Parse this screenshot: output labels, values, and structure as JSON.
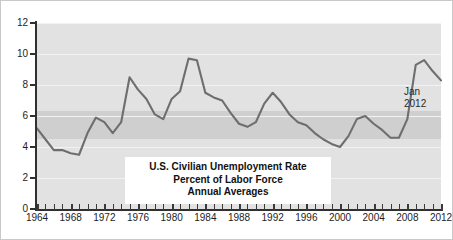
{
  "chart_data": {
    "type": "line",
    "title": "U.S. Civilian Unemployment Rate",
    "subtitle": "Percent of Labor Force",
    "subtitle2": "Annual Averages",
    "xlabel": "",
    "ylabel": "",
    "xlim": [
      1964,
      2012
    ],
    "ylim": [
      0,
      12
    ],
    "grid": true,
    "legend": null,
    "y_ticks": [
      0,
      2,
      4,
      6,
      8,
      10,
      12
    ],
    "y_tick_labels": [
      "0",
      "2",
      "4",
      "6",
      "8",
      "10",
      "12"
    ],
    "x_ticks": [
      1964,
      1968,
      1972,
      1976,
      1980,
      1984,
      1988,
      1992,
      1996,
      2000,
      2004,
      2008,
      2012
    ],
    "x_tick_labels": [
      "1964",
      "1968",
      "1972",
      "1976",
      "1980",
      "1984",
      "1988",
      "1992",
      "1996",
      "2000",
      "2004",
      "2008",
      "2012"
    ],
    "x_minor_tick_interval": 1,
    "shaded_band": {
      "from": 4.5,
      "to": 6.3,
      "color": "#cfcfcf"
    },
    "plot_background": "#e2e2e2",
    "line_color": "#6e6e6e",
    "annotations": [
      {
        "text_line1": "Jan",
        "text_line2": "2012",
        "x": 2012,
        "y": 8.3
      }
    ],
    "x": [
      1964,
      1965,
      1966,
      1967,
      1968,
      1969,
      1970,
      1971,
      1972,
      1973,
      1974,
      1975,
      1976,
      1977,
      1978,
      1979,
      1980,
      1981,
      1982,
      1983,
      1984,
      1985,
      1986,
      1987,
      1988,
      1989,
      1990,
      1991,
      1992,
      1993,
      1994,
      1995,
      1996,
      1997,
      1998,
      1999,
      2000,
      2001,
      2002,
      2003,
      2004,
      2005,
      2006,
      2007,
      2008,
      2009,
      2010,
      2011,
      2012
    ],
    "values": [
      5.2,
      4.5,
      3.8,
      3.8,
      3.6,
      3.5,
      4.9,
      5.9,
      5.6,
      4.9,
      5.6,
      8.5,
      7.7,
      7.1,
      6.1,
      5.8,
      7.1,
      7.6,
      9.7,
      9.6,
      7.5,
      7.2,
      7.0,
      6.2,
      5.5,
      5.3,
      5.6,
      6.8,
      7.5,
      6.9,
      6.1,
      5.6,
      5.4,
      4.9,
      4.5,
      4.2,
      4.0,
      4.7,
      5.8,
      6.0,
      5.5,
      5.1,
      4.6,
      4.6,
      5.8,
      9.3,
      9.6,
      8.9,
      8.3
    ]
  },
  "colors": {
    "line": "#6e6e6e",
    "panel": "#e2e2e2",
    "band": "#cfcfcf",
    "axis": "#303030",
    "text": "#1d1d1d",
    "grid": "#f2f2f2",
    "title_box": "#ffffff"
  }
}
